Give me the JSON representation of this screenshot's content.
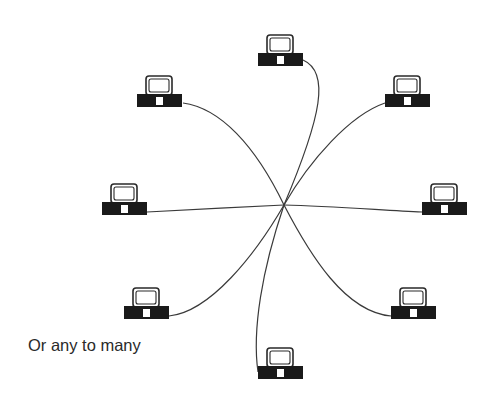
{
  "caption": "Or any to many",
  "colors": {
    "line": "#3a3a3a",
    "computer_base": "#1a1a1a",
    "monitor_outline": "#2a2a2a",
    "background": "#ffffff"
  },
  "hub": {
    "x": 284,
    "y": 205
  },
  "computers": [
    {
      "id": "top",
      "x": 258,
      "y": 34
    },
    {
      "id": "upper-left",
      "x": 137,
      "y": 75
    },
    {
      "id": "upper-right",
      "x": 385,
      "y": 75
    },
    {
      "id": "left",
      "x": 102,
      "y": 183
    },
    {
      "id": "right",
      "x": 422,
      "y": 183
    },
    {
      "id": "lower-left",
      "x": 124,
      "y": 287
    },
    {
      "id": "lower-right",
      "x": 391,
      "y": 287
    },
    {
      "id": "bottom",
      "x": 258,
      "y": 347
    }
  ]
}
